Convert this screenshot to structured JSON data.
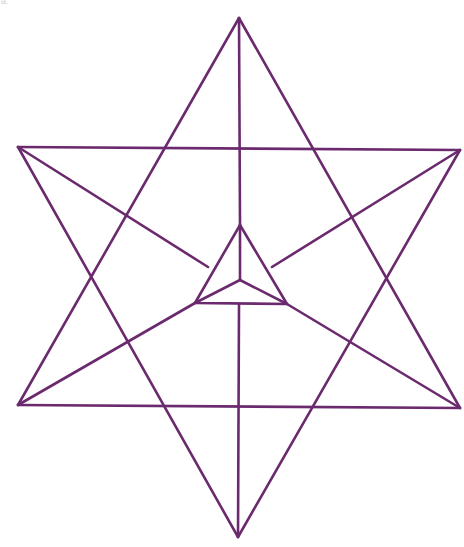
{
  "figure": {
    "label": "a.",
    "stroke_color": "#6b2a6e",
    "stroke_width": 2.6,
    "shape": "star-tetrahedron",
    "outer_points": {
      "apex_top": [
        239,
        18
      ],
      "bottom": [
        238,
        537
      ],
      "upper_left": [
        18,
        147
      ],
      "upper_right": [
        460,
        150
      ],
      "lower_left": [
        18,
        405
      ],
      "lower_right": [
        460,
        408
      ]
    },
    "inner_triangle": {
      "top": [
        240,
        225
      ],
      "bottom_left": [
        195,
        303
      ],
      "bottom_right": [
        287,
        304
      ],
      "center": [
        240,
        280
      ]
    }
  }
}
